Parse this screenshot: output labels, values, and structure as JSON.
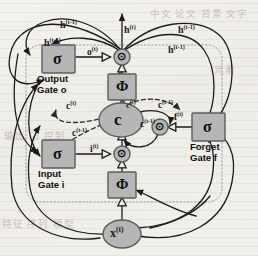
{
  "figure": {
    "background_color": "#f1efea",
    "node_fill": "#b6b6b6",
    "node_stroke": "#5d5d5d",
    "line_color": "#1b1b1b",
    "dashed_color": "#2a2a2a",
    "boundary_color": "#9a9a9a"
  },
  "ghost_text": {
    "top_right": "中文 论文 背景 文字",
    "mid_right": "元素",
    "left_mid": "输出 门 控制",
    "bottom_left": "特征 序列 模型"
  },
  "gates": {
    "output": {
      "symbol": "σ",
      "line1": "Output",
      "line2": "Gate o"
    },
    "input": {
      "symbol": "σ",
      "line1": "Input",
      "line2": "Gate i"
    },
    "forget": {
      "symbol": "σ",
      "line1": "Forget",
      "line2": "Gate f"
    }
  },
  "nodes": {
    "cell": {
      "label": "c",
      "shape": "ellipse"
    },
    "input_node": {
      "label": "x",
      "sup": "(t)",
      "shape": "ellipse"
    },
    "phi_top": {
      "label": "Φ",
      "shape": "square"
    },
    "phi_bottom": {
      "label": "Φ",
      "shape": "square"
    },
    "mult_top": {
      "label": "⊙",
      "shape": "circle"
    },
    "mult_input": {
      "label": "⊙",
      "shape": "circle"
    },
    "mult_forget": {
      "label": "⊙",
      "shape": "circle"
    }
  },
  "edge_labels": {
    "h_out": {
      "base": "h",
      "sup": "(t)"
    },
    "h_rec_left": {
      "base": "h",
      "sup": "(t-1)"
    },
    "h_rec_left2": {
      "base": "h",
      "sup": "(t-1)"
    },
    "h_rec_right": {
      "base": "h",
      "sup": "(t-1)"
    },
    "h_rec_right2": {
      "base": "h",
      "sup": "(t-1)"
    },
    "o_t": {
      "base": "o",
      "sup": "(t)"
    },
    "i_t": {
      "base": "i",
      "sup": "(t)"
    },
    "f_t": {
      "base": "f",
      "sup": "(t)"
    },
    "c_t_up": {
      "base": "c",
      "sup": "(t)"
    },
    "c_t_dash": {
      "base": "c",
      "sup": "(t)"
    },
    "c_prev_left": {
      "base": "c",
      "sup": "(t-1)"
    },
    "c_prev_mid": {
      "base": "c",
      "sup": "(t-1)"
    },
    "c_prev_right": {
      "base": "c",
      "sup": "(t-1)"
    }
  }
}
